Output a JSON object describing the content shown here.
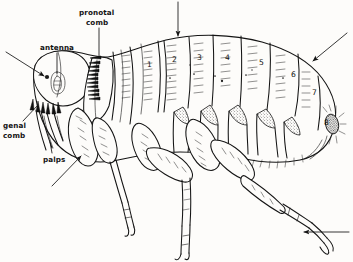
{
  "figure": {
    "view": "lateral",
    "style": "ink line drawing",
    "background_color": "#fdfcfa",
    "ink_color": "#141414"
  },
  "labels": [
    {
      "id": "antenna",
      "text_lines": [
        "antenna"
      ],
      "x": 46,
      "y": 46,
      "leader": "vertical-down",
      "target": "antennal fossa"
    },
    {
      "id": "pronotal-comb",
      "text_lines": [
        "pronotal",
        "comb"
      ],
      "x": 84,
      "y": 13,
      "leader": "vertical-down",
      "target": "pronotal ctenidium"
    },
    {
      "id": "genal-comb",
      "text_lines": [
        "genal",
        "comb"
      ],
      "x": 4,
      "y": 124,
      "leader": "diagonal-up-right",
      "target": "genal ctenidium"
    },
    {
      "id": "palps",
      "text_lines": [
        "palps"
      ],
      "x": 46,
      "y": 158,
      "leader": "vertical-up",
      "target": "maxillary palps"
    }
  ],
  "segment_numbers": [
    {
      "n": "1",
      "x": 148,
      "y": 65
    },
    {
      "n": "2",
      "x": 173,
      "y": 60
    },
    {
      "n": "3",
      "x": 198,
      "y": 58
    },
    {
      "n": "4",
      "x": 226,
      "y": 58
    },
    {
      "n": "5",
      "x": 260,
      "y": 63
    },
    {
      "n": "6",
      "x": 292,
      "y": 75
    },
    {
      "n": "7",
      "x": 313,
      "y": 93
    },
    {
      "n": "8",
      "x": 325,
      "y": 123
    }
  ],
  "arrows": [
    {
      "id": "arrow-top",
      "from": [
        178,
        2
      ],
      "to": [
        178,
        38
      ],
      "direction": "down",
      "points_at": "abdominal tergite 2"
    },
    {
      "id": "arrow-upper-right",
      "from": [
        347,
        33
      ],
      "to": [
        311,
        62
      ],
      "direction": "down-left",
      "points_at": "abdominal tergite 7"
    },
    {
      "id": "arrow-lower-left",
      "from": [
        52,
        186
      ],
      "to": [
        83,
        154
      ],
      "direction": "up-right",
      "points_at": "fore coxa"
    },
    {
      "id": "arrow-lower-right",
      "from": [
        349,
        232
      ],
      "to": [
        302,
        232
      ],
      "direction": "left",
      "points_at": "hind tarsus"
    }
  ],
  "anatomy_parts": [
    "head",
    "eye",
    "antennal fossa",
    "antenna",
    "genal comb",
    "maxillary palps",
    "pronotum",
    "pronotal comb",
    "mesothorax",
    "metathorax",
    "abdominal tergites 1-8",
    "sternites",
    "sensilium",
    "fore leg",
    "middle leg",
    "hind leg",
    "coxa",
    "femur",
    "tibia",
    "tarsus",
    "claws"
  ]
}
